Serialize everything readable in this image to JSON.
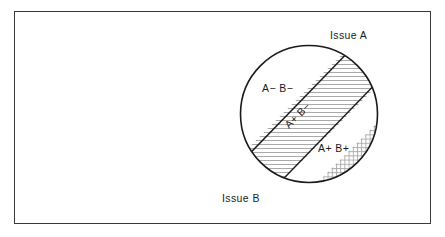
{
  "figure": {
    "frame": {
      "border_color": "#3a3a3a",
      "background_color": "#ffffff"
    }
  },
  "axes": {
    "issue_a_label": "Issue A",
    "issue_b_label": "Issue B"
  },
  "circle": {
    "center_x": 309,
    "center_y": 114,
    "radius": 69,
    "stroke_color": "#1a1a1a",
    "fill_color": "#ffffff"
  },
  "regions": [
    {
      "id": "a-minus-b-minus",
      "label": "A− B−",
      "fill_style": "plain",
      "fill_color": "#ffffff",
      "position": "upper-left",
      "label_rotated": false
    },
    {
      "id": "a-plus-b-minus",
      "label": "A+ B−",
      "fill_style": "horizontal-hatch",
      "fill_color": "#b4b4b4",
      "position": "middle-band",
      "label_rotated": true,
      "label_rotation_deg": -45
    },
    {
      "id": "a-plus-b-plus",
      "label": "A+ B+",
      "fill_style": "cross-hatch",
      "fill_color": "#b0b0b0",
      "position": "lower-right",
      "label_rotated": false
    }
  ],
  "dividers": {
    "count": 2,
    "orientation": "diagonal-45",
    "stroke_color": "#1a1a1a",
    "description": "two parallel lines running lower-left to upper-right"
  },
  "colors": {
    "line": "#1a1a1a",
    "frame": "#3a3a3a",
    "hatch": "#b4b4b4",
    "text": "#1a1a1a",
    "background": "#ffffff"
  }
}
